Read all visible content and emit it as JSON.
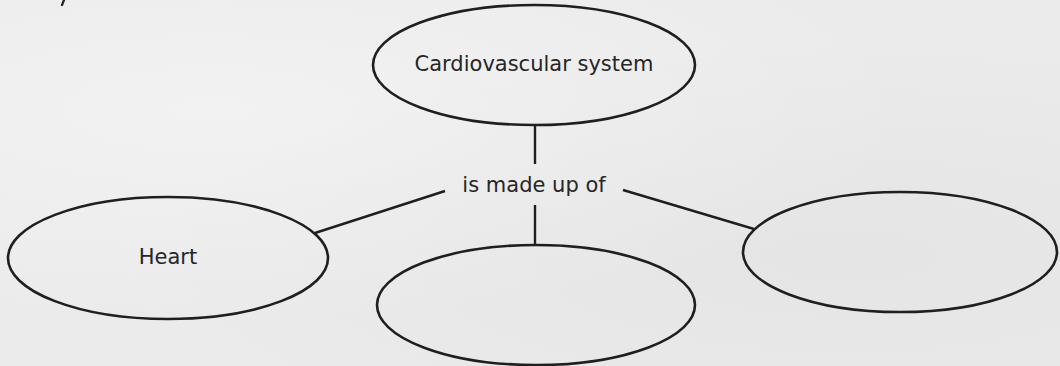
{
  "diagram": {
    "type": "concept-map",
    "root": {
      "id": "cardiovascular-system",
      "label": "Cardiovascular system",
      "center": [
        534,
        65
      ],
      "rx": 161,
      "ry": 60
    },
    "relation": {
      "label": "is made up of",
      "position": [
        534,
        186
      ]
    },
    "children": [
      {
        "id": "heart",
        "label": "Heart",
        "center": [
          168,
          258
        ],
        "rx": 160,
        "ry": 61
      },
      {
        "id": "blank-middle",
        "label": "",
        "center": [
          536,
          305
        ],
        "rx": 159,
        "ry": 60
      },
      {
        "id": "blank-right",
        "label": "",
        "center": [
          900,
          252
        ],
        "rx": 157,
        "ry": 60
      }
    ],
    "colors": {
      "ink": "#1f1f1f",
      "text": "#262626",
      "paper": "#ebebeb"
    }
  }
}
